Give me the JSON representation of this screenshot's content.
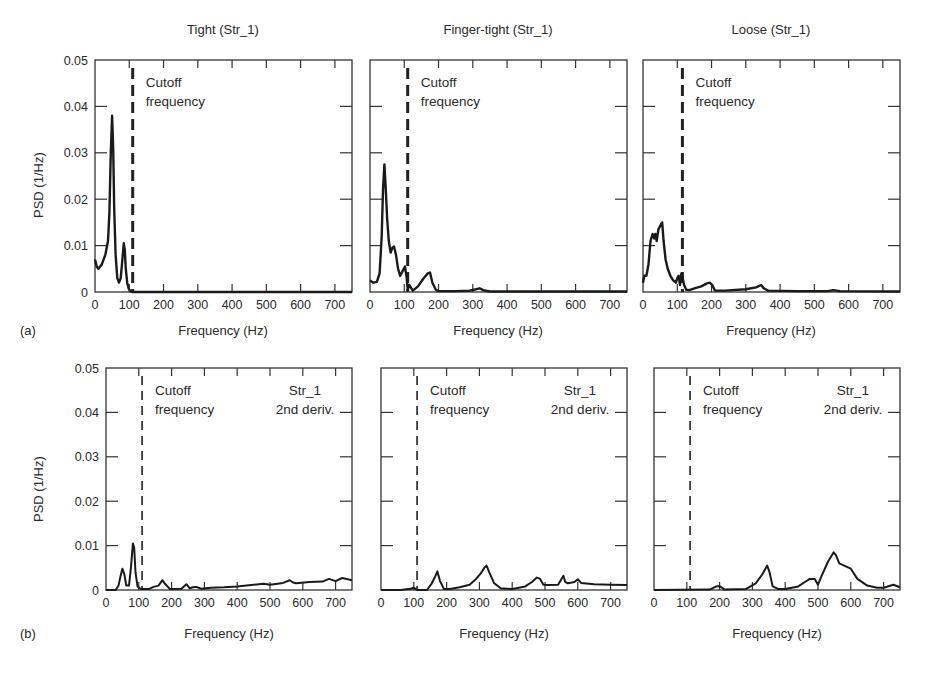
{
  "figure": {
    "row_labels": [
      "(a)",
      "(b)"
    ],
    "annotation_cutoff": [
      "Cutoff",
      "frequency"
    ],
    "annotation_str": [
      "Str_1",
      "2nd deriv."
    ]
  },
  "chart_data": [
    {
      "id": "a1",
      "row": "a",
      "type": "line",
      "title": "Tight (Str_1)",
      "xlabel": "Frequency (Hz)",
      "ylabel": "PSD (1/Hz)",
      "xlim": [
        0,
        750
      ],
      "ylim": [
        0,
        0.05
      ],
      "xticks": [
        0,
        100,
        200,
        300,
        400,
        500,
        600,
        700
      ],
      "yticks": [
        0,
        0.01,
        0.02,
        0.03,
        0.04,
        0.05
      ],
      "grid": false,
      "cutoff_frequency": 110,
      "annotations": [
        "Cutoff frequency"
      ],
      "series": [
        {
          "name": "PSD",
          "x": [
            0,
            5,
            10,
            20,
            30,
            38,
            42,
            46,
            50,
            53,
            56,
            60,
            65,
            70,
            75,
            80,
            84,
            87,
            90,
            94,
            98,
            103,
            108,
            750
          ],
          "y": [
            0.007,
            0.0055,
            0.005,
            0.006,
            0.008,
            0.011,
            0.017,
            0.03,
            0.038,
            0.031,
            0.018,
            0.008,
            0.003,
            0.002,
            0.003,
            0.007,
            0.0105,
            0.009,
            0.005,
            0.002,
            0.0008,
            0.0002,
            0.0,
            0.0
          ]
        }
      ]
    },
    {
      "id": "a2",
      "row": "a",
      "type": "line",
      "title": "Finger-tight (Str_1)",
      "xlabel": "Frequency (Hz)",
      "ylabel": "",
      "xlim": [
        0,
        750
      ],
      "ylim": [
        0,
        0.05
      ],
      "xticks": [
        0,
        100,
        200,
        300,
        400,
        500,
        600,
        700
      ],
      "yticks": [
        0,
        0.01,
        0.02,
        0.03,
        0.04,
        0.05
      ],
      "grid": false,
      "cutoff_frequency": 110,
      "annotations": [
        "Cutoff frequency"
      ],
      "series": [
        {
          "name": "PSD",
          "x": [
            0,
            10,
            20,
            28,
            34,
            38,
            42,
            46,
            50,
            55,
            60,
            65,
            70,
            76,
            82,
            88,
            95,
            102,
            107,
            110,
            115,
            125,
            140,
            155,
            168,
            175,
            182,
            192,
            200,
            250,
            290,
            310,
            320,
            330,
            350,
            750
          ],
          "y": [
            0.0025,
            0.002,
            0.0022,
            0.004,
            0.012,
            0.022,
            0.0275,
            0.022,
            0.016,
            0.011,
            0.0085,
            0.0095,
            0.0098,
            0.008,
            0.005,
            0.0035,
            0.0045,
            0.0055,
            0.003,
            0.0005,
            0.0015,
            0.0003,
            0.0012,
            0.0028,
            0.004,
            0.0042,
            0.002,
            0.0005,
            0.0002,
            0.0002,
            0.0003,
            0.0006,
            0.0008,
            0.0004,
            0.0001,
            0.0001
          ]
        }
      ]
    },
    {
      "id": "a3",
      "row": "a",
      "type": "line",
      "title": "Loose (Str_1)",
      "xlabel": "Frequency (Hz)",
      "ylabel": "",
      "xlim": [
        0,
        750
      ],
      "ylim": [
        0,
        0.05
      ],
      "xticks": [
        0,
        100,
        200,
        300,
        400,
        500,
        600,
        700
      ],
      "yticks": [
        0,
        0.01,
        0.02,
        0.03,
        0.04,
        0.05
      ],
      "grid": false,
      "cutoff_frequency": 115,
      "annotations": [
        "Cutoff frequency"
      ],
      "series": [
        {
          "name": "PSD",
          "x": [
            0,
            4,
            10,
            16,
            22,
            28,
            33,
            36,
            40,
            45,
            52,
            56,
            60,
            66,
            72,
            80,
            88,
            96,
            100,
            104,
            108,
            112,
            116,
            120,
            126,
            135,
            150,
            170,
            185,
            195,
            202,
            210,
            240,
            300,
            330,
            345,
            352,
            365,
            450,
            540,
            555,
            575,
            750
          ],
          "y": [
            0.002,
            0.0035,
            0.0035,
            0.006,
            0.011,
            0.0125,
            0.0115,
            0.0125,
            0.011,
            0.0135,
            0.0145,
            0.015,
            0.011,
            0.007,
            0.005,
            0.0035,
            0.0025,
            0.002,
            0.003,
            0.0035,
            0.0015,
            0.004,
            0.003,
            0.0015,
            0.0005,
            0.0004,
            0.0008,
            0.0012,
            0.0018,
            0.002,
            0.0015,
            0.0003,
            0.0003,
            0.0006,
            0.001,
            0.0015,
            0.0008,
            0.0003,
            0.0002,
            0.0002,
            0.0004,
            0.0002,
            0.0001
          ]
        }
      ]
    },
    {
      "id": "b1",
      "row": "b",
      "type": "line",
      "title": "",
      "xlabel": "Frequency (Hz)",
      "ylabel": "PSD (1/Hz)",
      "xlim": [
        0,
        750
      ],
      "ylim": [
        0,
        0.05
      ],
      "xticks": [
        0,
        100,
        200,
        300,
        400,
        500,
        600,
        700
      ],
      "yticks": [
        0,
        0.01,
        0.02,
        0.03,
        0.04,
        0.05
      ],
      "grid": false,
      "cutoff_frequency": 110,
      "annotations": [
        "Cutoff frequency",
        "Str_1 2nd deriv."
      ],
      "series": [
        {
          "name": "PSD 2nd derivative",
          "x": [
            0,
            30,
            38,
            44,
            50,
            56,
            62,
            70,
            76,
            82,
            86,
            90,
            96,
            102,
            110,
            130,
            145,
            160,
            172,
            180,
            195,
            230,
            245,
            255,
            265,
            275,
            290,
            320,
            360,
            400,
            450,
            480,
            500,
            540,
            560,
            570,
            580,
            620,
            660,
            680,
            700,
            720,
            750
          ],
          "y": [
            0.0,
            0.0,
            0.001,
            0.003,
            0.0048,
            0.0035,
            0.001,
            0.001,
            0.005,
            0.0105,
            0.0095,
            0.004,
            0.0008,
            0.0004,
            0.0002,
            0.0002,
            0.0007,
            0.001,
            0.0022,
            0.0014,
            0.0002,
            0.0003,
            0.0013,
            0.0004,
            0.0006,
            0.0007,
            0.0003,
            0.0005,
            0.0006,
            0.0008,
            0.0012,
            0.0014,
            0.0012,
            0.0016,
            0.0022,
            0.0017,
            0.0015,
            0.0018,
            0.0019,
            0.0025,
            0.002,
            0.0027,
            0.0022
          ]
        }
      ]
    },
    {
      "id": "b2",
      "row": "b",
      "type": "line",
      "title": "",
      "xlabel": "Frequency (Hz)",
      "ylabel": "",
      "xlim": [
        0,
        750
      ],
      "ylim": [
        0,
        0.05
      ],
      "xticks": [
        0,
        100,
        200,
        300,
        400,
        500,
        600,
        700
      ],
      "yticks": [
        0,
        0.01,
        0.02,
        0.03,
        0.04,
        0.05
      ],
      "grid": false,
      "cutoff_frequency": 110,
      "annotations": [
        "Cutoff frequency",
        "Str_1 2nd deriv."
      ],
      "series": [
        {
          "name": "PSD 2nd derivative",
          "x": [
            0,
            60,
            90,
            100,
            110,
            140,
            155,
            165,
            172,
            180,
            192,
            210,
            240,
            270,
            290,
            305,
            315,
            322,
            330,
            345,
            365,
            400,
            440,
            460,
            475,
            485,
            495,
            505,
            540,
            556,
            562,
            570,
            590,
            600,
            610,
            650,
            700,
            750
          ],
          "y": [
            0.0,
            0.0,
            0.0003,
            0.0005,
            0.0,
            0.0,
            0.0015,
            0.003,
            0.0042,
            0.002,
            0.0002,
            0.0002,
            0.0006,
            0.0012,
            0.0025,
            0.0038,
            0.005,
            0.0055,
            0.004,
            0.0015,
            0.0004,
            0.0002,
            0.0008,
            0.0018,
            0.0028,
            0.0025,
            0.0012,
            0.0011,
            0.0012,
            0.0032,
            0.0018,
            0.0015,
            0.0018,
            0.0024,
            0.0016,
            0.0013,
            0.0012,
            0.0011
          ]
        }
      ]
    },
    {
      "id": "b3",
      "row": "b",
      "type": "line",
      "title": "",
      "xlabel": "Frequency (Hz)",
      "ylabel": "",
      "xlim": [
        0,
        750
      ],
      "ylim": [
        0,
        0.05
      ],
      "xticks": [
        0,
        100,
        200,
        300,
        400,
        500,
        600,
        700
      ],
      "yticks": [
        0,
        0.01,
        0.02,
        0.03,
        0.04,
        0.05
      ],
      "grid": false,
      "cutoff_frequency": 110,
      "annotations": [
        "Cutoff frequency",
        "Str_1 2nd deriv."
      ],
      "series": [
        {
          "name": "PSD 2nd derivative",
          "x": [
            0,
            170,
            190,
            200,
            215,
            280,
            310,
            330,
            345,
            352,
            362,
            380,
            400,
            440,
            460,
            475,
            490,
            500,
            510,
            530,
            548,
            555,
            565,
            580,
            600,
            620,
            650,
            680,
            700,
            730,
            750
          ],
          "y": [
            0.0,
            0.0001,
            0.0008,
            0.0009,
            0.0001,
            0.0002,
            0.0015,
            0.0035,
            0.0055,
            0.004,
            0.0008,
            0.0002,
            0.0002,
            0.0008,
            0.0018,
            0.0025,
            0.0025,
            0.0012,
            0.003,
            0.0063,
            0.0085,
            0.0078,
            0.006,
            0.0055,
            0.0048,
            0.0025,
            0.001,
            0.0005,
            0.0005,
            0.0012,
            0.0006
          ]
        }
      ]
    }
  ]
}
